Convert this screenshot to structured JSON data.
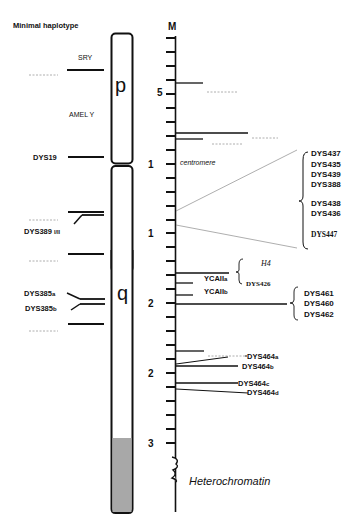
{
  "title": "Minimal haplotype",
  "scale_label": "M",
  "arm_labels": {
    "p": "p",
    "q": "q"
  },
  "left_markers": {
    "sry": "SRY",
    "amel": "AMEL Y",
    "dys19": "DYS19",
    "dys389_main": "DYS389",
    "dys389_sub": "I/II",
    "dys385a_main": "DYS385",
    "dys385a_sub": "a",
    "dys385b_main": "DYS385",
    "dys385b_sub": "b"
  },
  "ruler_numbers": [
    "5",
    "1",
    "1",
    "2",
    "2",
    "3"
  ],
  "centromere_label": "centromere",
  "heterochromatin_label": "Heterochromatin",
  "cluster1": [
    "DYS437",
    "DYS435",
    "DYS439",
    "DYS388",
    "DYS438",
    "DYS436",
    "DYS447"
  ],
  "h4_label": "H4",
  "dys426": "DYS426",
  "ycaii": {
    "a_main": "YCAII",
    "a_sub": "a",
    "b_main": "YCAII",
    "b_sub": "b"
  },
  "cluster2": [
    "DYS461",
    "DYS460",
    "DYS462"
  ],
  "dys464": [
    {
      "main": "DYS464",
      "sub": "a"
    },
    {
      "main": "DYS464",
      "sub": "b"
    },
    {
      "main": "DYS464",
      "sub": "c"
    },
    {
      "main": "DYS464",
      "sub": "d"
    }
  ],
  "colors": {
    "line": "#111111",
    "heterochromatin": "#a8a8a8",
    "dashed": "#888888"
  }
}
